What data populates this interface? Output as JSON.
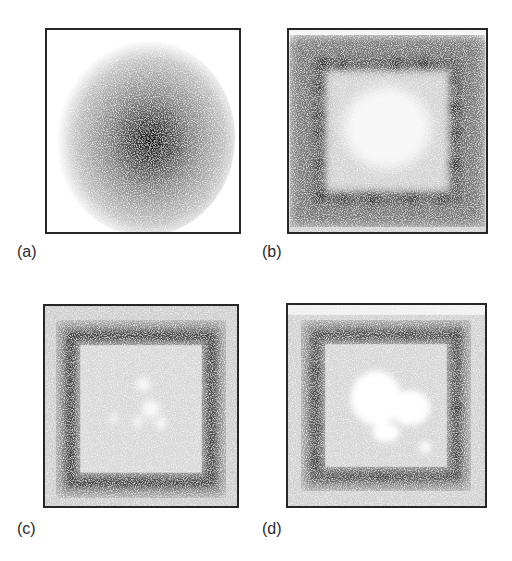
{
  "figure": {
    "panels": [
      {
        "id": "a",
        "label": "(a)",
        "pattern": "central dark radial blob, grainy gray halo"
      },
      {
        "id": "b",
        "label": "(b)",
        "pattern": "dark square ring with discrete dark spots, light speckled center"
      },
      {
        "id": "c",
        "label": "(c)",
        "pattern": "continuous dark square ring, light gray center with small white patches"
      },
      {
        "id": "d",
        "label": "(d)",
        "pattern": "dark square ring with faint spots, large white patches in center"
      }
    ]
  },
  "colors": {
    "frame": "#262626",
    "background": "#ffffff",
    "label": "#2a2a2a"
  }
}
